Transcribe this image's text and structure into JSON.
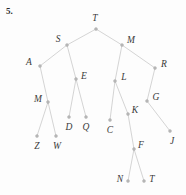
{
  "figure": {
    "problem_number": "5.",
    "caption": "",
    "type": "binary-tree-diagram",
    "width": 186,
    "height": 195,
    "colors": {
      "edge": "#cfcfcf",
      "node": "#b9b9b9",
      "label": "#3a3a3a",
      "background": "#fdfdfd"
    }
  },
  "tree": {
    "root": "T",
    "nodes": [
      {
        "id": "T",
        "label": "T",
        "x": 96,
        "y": 29,
        "lx": 95,
        "ly": 19
      },
      {
        "id": "S",
        "label": "S",
        "x": 67,
        "y": 45,
        "lx": 58,
        "ly": 40
      },
      {
        "id": "M1",
        "label": "M",
        "x": 122,
        "y": 45,
        "lx": 131,
        "ly": 41
      },
      {
        "id": "A",
        "label": "A",
        "x": 40,
        "y": 66,
        "lx": 29,
        "ly": 63
      },
      {
        "id": "E",
        "label": "E",
        "x": 76,
        "y": 79,
        "lx": 84,
        "ly": 77
      },
      {
        "id": "L",
        "label": "L",
        "x": 115,
        "y": 81,
        "lx": 124,
        "ly": 78
      },
      {
        "id": "R",
        "label": "R",
        "x": 155,
        "y": 68,
        "lx": 164,
        "ly": 65
      },
      {
        "id": "M2",
        "label": "M",
        "x": 48,
        "y": 102,
        "lx": 38,
        "ly": 100
      },
      {
        "id": "G",
        "label": "G",
        "x": 147,
        "y": 101,
        "lx": 156,
        "ly": 98
      },
      {
        "id": "D",
        "label": "D",
        "x": 69,
        "y": 117,
        "lx": 69,
        "ly": 128
      },
      {
        "id": "Q",
        "label": "Q",
        "x": 86,
        "y": 117,
        "lx": 86,
        "ly": 128
      },
      {
        "id": "C",
        "label": "C",
        "x": 110,
        "y": 120,
        "lx": 110,
        "ly": 131
      },
      {
        "id": "K",
        "label": "K",
        "x": 128,
        "y": 114,
        "lx": 135,
        "ly": 111
      },
      {
        "id": "Z",
        "label": "Z",
        "x": 37,
        "y": 136,
        "lx": 37,
        "ly": 147
      },
      {
        "id": "W",
        "label": "W",
        "x": 56,
        "y": 136,
        "lx": 57,
        "ly": 147
      },
      {
        "id": "J",
        "label": "J",
        "x": 170,
        "y": 131,
        "lx": 172,
        "ly": 142
      },
      {
        "id": "F",
        "label": "F",
        "x": 134,
        "y": 149,
        "lx": 141,
        "ly": 146
      },
      {
        "id": "N",
        "label": "N",
        "x": 128,
        "y": 181,
        "lx": 120,
        "ly": 180
      },
      {
        "id": "T2",
        "label": "T",
        "x": 144,
        "y": 181,
        "lx": 152,
        "ly": 180
      }
    ],
    "edges": [
      {
        "from": "T",
        "to": "S"
      },
      {
        "from": "T",
        "to": "M1"
      },
      {
        "from": "S",
        "to": "A"
      },
      {
        "from": "S",
        "to": "E"
      },
      {
        "from": "M1",
        "to": "L"
      },
      {
        "from": "M1",
        "to": "R"
      },
      {
        "from": "A",
        "to": "M2"
      },
      {
        "from": "E",
        "to": "D"
      },
      {
        "from": "E",
        "to": "Q"
      },
      {
        "from": "L",
        "to": "C"
      },
      {
        "from": "L",
        "to": "K"
      },
      {
        "from": "R",
        "to": "G"
      },
      {
        "from": "M2",
        "to": "Z"
      },
      {
        "from": "M2",
        "to": "W"
      },
      {
        "from": "G",
        "to": "J"
      },
      {
        "from": "K",
        "to": "F"
      },
      {
        "from": "F",
        "to": "N"
      },
      {
        "from": "F",
        "to": "T2"
      }
    ]
  }
}
